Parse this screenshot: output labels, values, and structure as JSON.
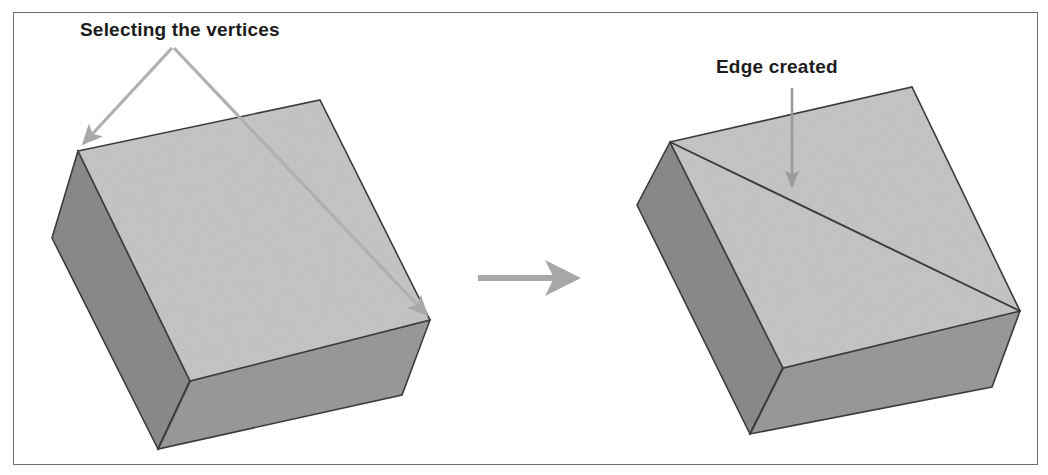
{
  "figure": {
    "title_alt": "Selecting the vertices and the resulting edge on a 3D box",
    "frame": {
      "border_color": "#6e6e6e"
    },
    "background_color": "#ffffff"
  },
  "annotations": [
    {
      "id": "selecting-the-vertices",
      "text": "Selecting the vertices",
      "x": 80,
      "y": 36,
      "anchor": "start",
      "color": "#1c1c1c"
    },
    {
      "id": "edge-created",
      "text": "Edge created",
      "x": 716,
      "y": 73,
      "anchor": "start",
      "color": "#1c1c1c"
    }
  ],
  "pointers": {
    "vertex_arrow": {
      "name": "double-vertex-pointer",
      "color": "#b0b0b0",
      "apex": [
        172,
        48
      ],
      "left_tip": [
        80,
        148
      ],
      "right_tip": [
        428,
        318
      ]
    },
    "edge_arrow": {
      "name": "edge-pointer",
      "color": "#9a9a9a",
      "from": [
        792,
        88
      ],
      "to": [
        792,
        192
      ]
    },
    "transition_arrow": {
      "name": "transition-arrow",
      "color": "#a8a8a8",
      "from": [
        478,
        278
      ],
      "to": [
        580,
        278
      ]
    }
  },
  "shapes": {
    "left_box": {
      "name": "box-before",
      "top_face": {
        "fill": "#c6c6c6",
        "points": "78,151 320,100 430,320 190,381"
      },
      "left_face": {
        "fill": "#8b8b8b",
        "points": "78,151 52,238 158,449 190,381"
      },
      "front_face": {
        "fill": "#9a9a9a",
        "points": "190,381 158,449 402,395 430,320"
      },
      "edge_color": "#3c3c3c",
      "has_diagonal_edge": false
    },
    "right_box": {
      "name": "box-after",
      "top_face": {
        "fill": "#c6c6c6",
        "points": "670,142 912,87 1020,311 783,368"
      },
      "left_face": {
        "fill": "#8b8b8b",
        "points": "670,142 637,205 750,434 783,368"
      },
      "front_face": {
        "fill": "#9a9a9a",
        "points": "783,368 750,434 992,387 1020,311"
      },
      "edge_color": "#3c3c3c",
      "has_diagonal_edge": true,
      "diagonal_edge": {
        "from": [
          670,
          142
        ],
        "to": [
          1020,
          311
        ]
      }
    }
  },
  "colors": {
    "top_face": "#c6c6c6",
    "left_face": "#8b8b8b",
    "front_face": "#9a9a9a",
    "outline": "#3c3c3c",
    "label": "#1c1c1c",
    "pointer_gray": "#aaaaaa"
  }
}
